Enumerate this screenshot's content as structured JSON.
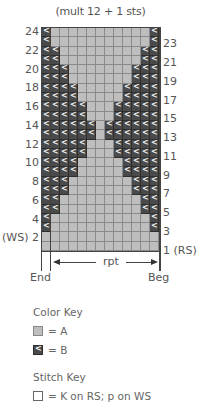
{
  "chart": {
    "title": "(mult 12 + 1 sts)",
    "columns": 13,
    "rows": 24,
    "row_patterns": {
      "24": "BAAAAAAAAAAAB",
      "23": "BAAAAAAAAAAAB",
      "22": "BBAAAAAAAAABB",
      "21": "BBAAAAAAAAABB",
      "20": "BBBAAAAAAABBB",
      "19": "BBBAAAAAAABBB",
      "18": "BBBBAAAAABBBB",
      "17": "BBBBAAAAABBBB",
      "16": "BBBBBAAABBBBB",
      "15": "BBBBBAAABBBBB",
      "14": "BBBBBBABBBBBB",
      "13": "BBBBBBABBBBBB",
      "12": "BBBBBAAABBBBB",
      "11": "BBBBBAAABBBBB",
      "10": "BBBBAAAAABBBB",
      "9": "BBBBAAAAABBBB",
      "8": "BBBAAAAAAABBB",
      "7": "BBBAAAAAAABBB",
      "6": "BBAAAAAAAAABB",
      "5": "BBAAAAAAAAABB",
      "4": "BAAAAAAAAAAAB",
      "3": "BAAAAAAAAAAAB",
      "2": "AAAAAAAAAAAAA",
      "1": "AAAAAAAAAAAAA"
    },
    "left_labels": [
      "24",
      "22",
      "20",
      "18",
      "16",
      "14",
      "12",
      "10",
      "8",
      "6",
      "4",
      "(WS) 2"
    ],
    "right_labels": [
      "23",
      "21",
      "19",
      "17",
      "15",
      "13",
      "11",
      "9",
      "7",
      "5",
      "3",
      "1 (RS)"
    ],
    "repeat_label": "rpt",
    "end_label": "End",
    "beg_label": "Beg"
  },
  "color_key": {
    "heading": "Color Key",
    "items": [
      {
        "swatch": "A",
        "label": "= A",
        "color": "#bebebe"
      },
      {
        "swatch": "B",
        "label": "= B",
        "color": "#4a4a4a"
      }
    ]
  },
  "stitch_key": {
    "heading": "Stitch Key",
    "items": [
      {
        "swatch": "K",
        "label": "= K on RS; p on WS"
      }
    ]
  }
}
